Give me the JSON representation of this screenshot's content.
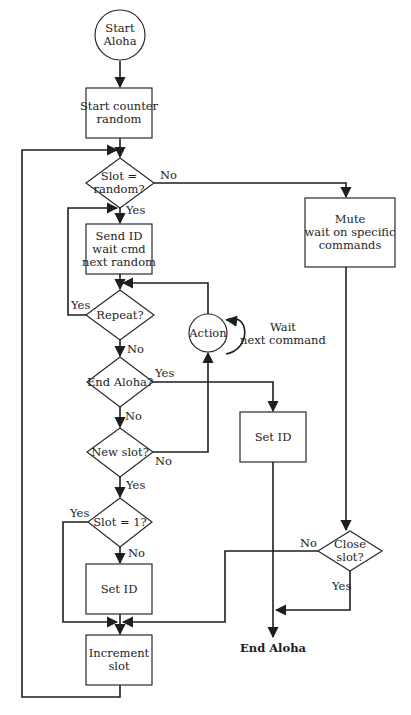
{
  "diagram": {
    "type": "flowchart",
    "colors": {
      "line": "#1e1e1e",
      "fill": "#ffffff",
      "background": "#ffffff"
    },
    "nodes": {
      "start": {
        "shape": "circle",
        "line1": "Start",
        "line2": "Aloha"
      },
      "start_counter": {
        "shape": "rect",
        "line1": "Start counter",
        "line2": "random"
      },
      "slot_random": {
        "shape": "diamond",
        "line1": "Slot =",
        "line2": "random?"
      },
      "mute": {
        "shape": "rect",
        "line1": "Mute",
        "line2": "wait on specific",
        "line3": "commands"
      },
      "send_id": {
        "shape": "rect",
        "line1": "Send ID",
        "line2": "wait cmd",
        "line3": "next random"
      },
      "repeat": {
        "shape": "diamond",
        "label": "Repeat?"
      },
      "action": {
        "shape": "circle",
        "label": "Action"
      },
      "wait_next": {
        "shape": "annotation",
        "line1": "Wait",
        "line2": "next command"
      },
      "end_aloha_q": {
        "shape": "diamond",
        "label": "End Aloha?"
      },
      "set_id_right": {
        "shape": "rect",
        "label": "Set ID"
      },
      "new_slot": {
        "shape": "diamond",
        "label": "New slot?"
      },
      "slot_eq_1": {
        "shape": "diamond",
        "label": "Slot = 1?"
      },
      "close_slot": {
        "shape": "diamond",
        "line1": "Close",
        "line2": "slot?"
      },
      "set_id_left": {
        "shape": "rect",
        "label": "Set ID"
      },
      "increment": {
        "shape": "rect",
        "line1": "Increment",
        "line2": "slot"
      },
      "end": {
        "shape": "terminal-text",
        "label": "End Aloha"
      }
    },
    "edge_labels": {
      "slot_random_no": "No",
      "slot_random_yes": "Yes",
      "repeat_yes": "Yes",
      "repeat_no": "No",
      "end_aloha_yes": "Yes",
      "end_aloha_no": "No",
      "new_slot_no": "No",
      "new_slot_yes": "Yes",
      "slot1_yes": "Yes",
      "slot1_no": "No",
      "close_no": "No",
      "close_yes": "Yes"
    },
    "edges": [
      {
        "from": "start",
        "to": "start_counter"
      },
      {
        "from": "start_counter",
        "to": "slot_random"
      },
      {
        "from": "slot_random",
        "to": "send_id",
        "label": "Yes"
      },
      {
        "from": "slot_random",
        "to": "mute",
        "label": "No"
      },
      {
        "from": "send_id",
        "to": "repeat"
      },
      {
        "from": "repeat",
        "to": "send_id",
        "label": "Yes"
      },
      {
        "from": "repeat",
        "to": "end_aloha_q",
        "label": "No"
      },
      {
        "from": "end_aloha_q",
        "to": "set_id_right",
        "label": "Yes"
      },
      {
        "from": "end_aloha_q",
        "to": "new_slot",
        "label": "No"
      },
      {
        "from": "new_slot",
        "to": "action",
        "label": "No"
      },
      {
        "from": "action",
        "to": "repeat"
      },
      {
        "from": "action",
        "to": "action",
        "label": "Wait next command"
      },
      {
        "from": "new_slot",
        "to": "slot_eq_1",
        "label": "Yes"
      },
      {
        "from": "slot_eq_1",
        "to": "set_id_left",
        "label": "No"
      },
      {
        "from": "slot_eq_1",
        "to": "increment",
        "label": "Yes"
      },
      {
        "from": "set_id_left",
        "to": "increment"
      },
      {
        "from": "mute",
        "to": "close_slot"
      },
      {
        "from": "close_slot",
        "to": "increment",
        "label": "No"
      },
      {
        "from": "close_slot",
        "to": "end",
        "label": "Yes"
      },
      {
        "from": "set_id_right",
        "to": "end"
      },
      {
        "from": "increment",
        "to": "slot_random"
      }
    ]
  }
}
